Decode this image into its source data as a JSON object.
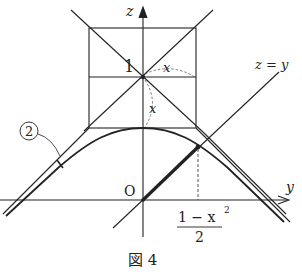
{
  "figure": {
    "caption": "図 4",
    "axes": {
      "z_label": "z",
      "y_label": "y",
      "origin_label": "O"
    },
    "labels": {
      "one": "1",
      "x_horizontal": "x",
      "x_vertical": "x",
      "line_label": "z = y",
      "curve_marker": "2",
      "fraction_numerator": "1 − x",
      "fraction_exponent": "2",
      "fraction_denominator": "2"
    },
    "colors": {
      "ink": "#222222",
      "background": "#ffffff"
    }
  }
}
